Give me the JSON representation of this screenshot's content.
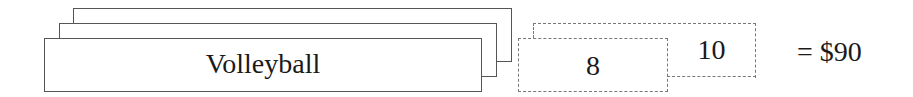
{
  "diagram": {
    "cards": {
      "label": "Volleyball",
      "stack_count": 3
    },
    "dashed_boxes": [
      {
        "value": "8"
      },
      {
        "value": "10"
      }
    ],
    "result": "= $90"
  }
}
